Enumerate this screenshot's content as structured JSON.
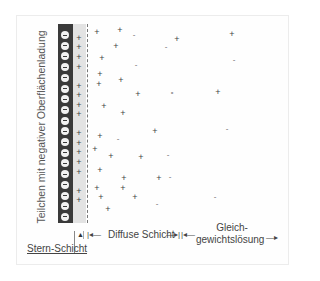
{
  "diagram": {
    "particle_label": "Teilchen mit negativer Oberflächenladung",
    "particle_color": "#3a3a3a",
    "stern_layer_color": "#e3e3e3",
    "surface_charges": {
      "count": 18,
      "symbol": "−"
    },
    "stern_ions": {
      "symbol": "+",
      "y": [
        38,
        47,
        57,
        67,
        86,
        95,
        105,
        114,
        133,
        143,
        152,
        162,
        172,
        191,
        200
      ]
    },
    "diffuse_ions": [
      {
        "s": "+",
        "x": 97,
        "y": 32
      },
      {
        "s": "+",
        "x": 120,
        "y": 30
      },
      {
        "s": "-",
        "x": 134,
        "y": 34
      },
      {
        "s": "+",
        "x": 177,
        "y": 39
      },
      {
        "s": "-",
        "x": 166,
        "y": 46
      },
      {
        "s": "+",
        "x": 232,
        "y": 34
      },
      {
        "s": "+",
        "x": 116,
        "y": 46
      },
      {
        "s": "-",
        "x": 234,
        "y": 59
      },
      {
        "s": "+",
        "x": 102,
        "y": 58
      },
      {
        "s": "-",
        "x": 136,
        "y": 64
      },
      {
        "s": "+",
        "x": 100,
        "y": 74
      },
      {
        "s": "+",
        "x": 121,
        "y": 80
      },
      {
        "s": "+",
        "x": 99,
        "y": 84
      },
      {
        "s": "-",
        "x": 172,
        "y": 91
      },
      {
        "s": "+",
        "x": 138,
        "y": 94
      },
      {
        "s": "+",
        "x": 218,
        "y": 92
      },
      {
        "s": "-",
        "x": 172,
        "y": 92
      },
      {
        "s": "+",
        "x": 104,
        "y": 106
      },
      {
        "s": "+",
        "x": 123,
        "y": 113
      },
      {
        "s": "+",
        "x": 155,
        "y": 131
      },
      {
        "s": "-",
        "x": 227,
        "y": 128
      },
      {
        "s": "+",
        "x": 100,
        "y": 136
      },
      {
        "s": "-",
        "x": 118,
        "y": 138
      },
      {
        "s": "+",
        "x": 95,
        "y": 149
      },
      {
        "s": "+",
        "x": 111,
        "y": 156
      },
      {
        "s": "+",
        "x": 141,
        "y": 157
      },
      {
        "s": "-",
        "x": 168,
        "y": 154
      },
      {
        "s": "+",
        "x": 100,
        "y": 170
      },
      {
        "s": "+",
        "x": 124,
        "y": 178
      },
      {
        "s": "+",
        "x": 159,
        "y": 178
      },
      {
        "s": "+",
        "x": 97,
        "y": 188
      },
      {
        "s": "+",
        "x": 123,
        "y": 188
      },
      {
        "s": "+",
        "x": 135,
        "y": 197
      },
      {
        "s": "+",
        "x": 101,
        "y": 197
      },
      {
        "s": "-",
        "x": 157,
        "y": 203
      },
      {
        "s": "+",
        "x": 108,
        "y": 209
      },
      {
        "s": "-",
        "x": 215,
        "y": 196
      },
      {
        "s": "-",
        "x": 170,
        "y": 176
      }
    ]
  },
  "labels": {
    "stern_layer": "Stern-Schicht",
    "diffuse_layer": "Diffuse Schicht",
    "equilibrium_line1": "Gleich-",
    "equilibrium_line2": "gewichtslösung"
  },
  "arrows": {
    "left": "|◂—",
    "right": "—▸|",
    "right_open": "—▸"
  }
}
